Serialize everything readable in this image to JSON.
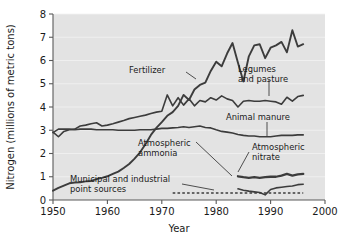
{
  "chart_data": {
    "type": "line",
    "title": "",
    "xlabel": "Year",
    "ylabel": "Nitrogen (millions of metric tons)",
    "xlim": [
      1950,
      2000
    ],
    "ylim": [
      0,
      8
    ],
    "xticks": [
      "1950",
      "1960",
      "1970",
      "1980",
      "1990",
      "2000"
    ],
    "xtick_values": [
      1950,
      1960,
      1970,
      1980,
      1990,
      2000
    ],
    "yticks": [
      "0",
      "1",
      "2",
      "3",
      "4",
      "5",
      "6",
      "7",
      "8"
    ],
    "ytick_values": [
      0,
      1,
      2,
      3,
      4,
      5,
      6,
      7,
      8
    ],
    "grid": "faint horizontal gridlines",
    "legend": "inline annotations with leader lines",
    "plot_background": "#e3e3e3",
    "line_color": "#3c3c3c",
    "series": [
      {
        "name": "Fertilizer",
        "label": "Fertilizer",
        "x": [
          1950,
          1951,
          1952,
          1953,
          1954,
          1955,
          1956,
          1957,
          1958,
          1959,
          1960,
          1961,
          1962,
          1963,
          1964,
          1965,
          1966,
          1967,
          1968,
          1969,
          1970,
          1971,
          1972,
          1973,
          1974,
          1975,
          1976,
          1977,
          1978,
          1979,
          1980,
          1981,
          1982,
          1983,
          1984,
          1985,
          1986,
          1987,
          1988,
          1989,
          1990,
          1991,
          1992,
          1993,
          1994,
          1995,
          1996
        ],
        "values": [
          0.4,
          0.52,
          0.62,
          0.72,
          0.75,
          0.76,
          0.8,
          0.82,
          0.9,
          0.95,
          1.02,
          1.12,
          1.22,
          1.38,
          1.55,
          1.78,
          2.05,
          2.4,
          2.8,
          3.1,
          3.35,
          3.62,
          3.78,
          4.05,
          4.52,
          4.3,
          4.75,
          4.95,
          5.05,
          5.55,
          5.95,
          5.75,
          6.3,
          6.75,
          5.9,
          5.1,
          6.18,
          6.65,
          6.7,
          6.1,
          6.55,
          6.65,
          6.8,
          6.35,
          7.3,
          6.6,
          6.7
        ]
      },
      {
        "name": "Legumes and pasture",
        "label": "Legumes and pasture",
        "x": [
          1950,
          1951,
          1952,
          1953,
          1954,
          1955,
          1956,
          1957,
          1958,
          1959,
          1960,
          1961,
          1962,
          1963,
          1964,
          1965,
          1966,
          1967,
          1968,
          1969,
          1970,
          1971,
          1972,
          1973,
          1974,
          1975,
          1976,
          1977,
          1978,
          1979,
          1980,
          1981,
          1982,
          1983,
          1984,
          1985,
          1986,
          1987,
          1988,
          1989,
          1990,
          1991,
          1992,
          1993,
          1994,
          1995,
          1996
        ],
        "values": [
          2.92,
          2.72,
          2.95,
          3.02,
          3.05,
          3.18,
          3.22,
          3.28,
          3.32,
          3.18,
          3.22,
          3.28,
          3.35,
          3.42,
          3.5,
          3.55,
          3.6,
          3.65,
          3.72,
          3.78,
          3.82,
          4.52,
          4.05,
          4.4,
          4.08,
          4.35,
          4.05,
          4.28,
          4.22,
          4.4,
          4.3,
          4.48,
          4.35,
          4.28,
          4.0,
          4.25,
          4.28,
          4.25,
          4.25,
          4.28,
          4.25,
          4.22,
          4.12,
          4.42,
          4.25,
          4.45,
          4.5
        ]
      },
      {
        "name": "Animal manure",
        "label": "Animal manure",
        "x": [
          1950,
          1951,
          1952,
          1953,
          1954,
          1955,
          1956,
          1957,
          1958,
          1959,
          1960,
          1961,
          1962,
          1963,
          1964,
          1965,
          1966,
          1967,
          1968,
          1969,
          1970,
          1971,
          1972,
          1973,
          1974,
          1975,
          1976,
          1977,
          1978,
          1979,
          1980,
          1981,
          1982,
          1983,
          1984,
          1985,
          1986,
          1987,
          1988,
          1989,
          1990,
          1991,
          1992,
          1993,
          1994,
          1995,
          1996
        ],
        "values": [
          2.9,
          3.05,
          3.05,
          3.05,
          3.02,
          3.05,
          3.05,
          3.05,
          3.02,
          3.02,
          3.02,
          3.02,
          3.0,
          3.0,
          3.0,
          3.0,
          3.02,
          3.02,
          3.02,
          3.05,
          3.08,
          3.08,
          3.1,
          3.12,
          3.15,
          3.12,
          3.15,
          3.18,
          3.12,
          3.1,
          3.02,
          2.95,
          2.92,
          2.88,
          2.82,
          2.78,
          2.75,
          2.75,
          2.72,
          2.72,
          2.72,
          2.75,
          2.78,
          2.78,
          2.78,
          2.8,
          2.8
        ]
      },
      {
        "name": "Atmospheric ammonia",
        "label": "Atmospheric ammonia",
        "x": [
          1984,
          1985,
          1986,
          1987,
          1988,
          1989,
          1990,
          1991,
          1992,
          1993,
          1994,
          1995,
          1996
        ],
        "values": [
          0.48,
          0.42,
          0.38,
          0.35,
          0.32,
          0.22,
          0.45,
          0.52,
          0.55,
          0.58,
          0.6,
          0.66,
          0.68
        ]
      },
      {
        "name": "Atmospheric nitrate",
        "label": "Atmospheric nitrate",
        "x": [
          1984,
          1985,
          1986,
          1987,
          1988,
          1989,
          1990,
          1991,
          1992,
          1993,
          1994,
          1995,
          1996
        ],
        "values": [
          1.02,
          0.98,
          0.95,
          0.98,
          0.95,
          0.98,
          1.0,
          1.0,
          1.05,
          1.12,
          1.05,
          1.1,
          1.12
        ]
      },
      {
        "name": "Municipal and industrial point sources",
        "label": "Municipal and industrial point sources",
        "style": "dashed",
        "x": [
          1972,
          1975,
          1980,
          1985,
          1990,
          1995,
          1996
        ],
        "values": [
          0.3,
          0.3,
          0.3,
          0.3,
          0.3,
          0.3,
          0.3
        ]
      }
    ],
    "annotations": [
      {
        "name": "fertilizer",
        "text": "Fertilizer"
      },
      {
        "name": "legumes-line1",
        "text": "Legumes"
      },
      {
        "name": "legumes-line2",
        "text": "and pasture"
      },
      {
        "name": "animal-manure",
        "text": "Animal manure"
      },
      {
        "name": "atmospheric-ammonia-line1",
        "text": "Atmospheric"
      },
      {
        "name": "atmospheric-ammonia-line2",
        "text": "ammonia"
      },
      {
        "name": "atmospheric-nitrate-line1",
        "text": "Atmospheric"
      },
      {
        "name": "atmospheric-nitrate-line2",
        "text": "nitrate"
      },
      {
        "name": "municipal-line1",
        "text": "Municipal and industrial"
      },
      {
        "name": "municipal-line2",
        "text": "point sources"
      }
    ]
  }
}
